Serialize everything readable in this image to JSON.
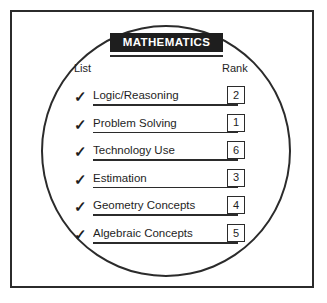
{
  "worksheet": {
    "title": "MATHEMATICS",
    "columns": {
      "list_header": "List",
      "rank_header": "Rank"
    },
    "check_glyph": "✓",
    "colors": {
      "ink": "#1e1e1e",
      "line": "#2b2b2b",
      "banner_background": "#1e1e1e",
      "banner_text": "#ffffff",
      "paper": "#ffffff"
    },
    "rows": [
      {
        "checked": true,
        "label": "Logic/Reasoning",
        "rank": "2"
      },
      {
        "checked": true,
        "label": "Problem Solving",
        "rank": "1"
      },
      {
        "checked": true,
        "label": "Technology Use",
        "rank": "6"
      },
      {
        "checked": true,
        "label": "Estimation",
        "rank": "3"
      },
      {
        "checked": true,
        "label": "Geometry Concepts",
        "rank": "4"
      },
      {
        "checked": true,
        "label": "Algebraic Concepts",
        "rank": "5"
      }
    ]
  }
}
